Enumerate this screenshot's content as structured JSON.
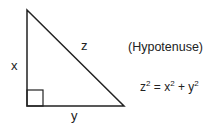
{
  "diagram": {
    "type": "right-triangle",
    "labels": {
      "x": "x",
      "y": "y",
      "z": "z",
      "hypotenuse_note": "(Hypotenuse)"
    },
    "equation": {
      "lhs_base": "z",
      "lhs_exp": "2",
      "equals": " = ",
      "t1_base": "x",
      "t1_exp": "2",
      "plus": " + ",
      "t2_base": "y",
      "t2_exp": "2"
    },
    "colors": {
      "stroke": "#222222",
      "background": "#ffffff"
    }
  }
}
